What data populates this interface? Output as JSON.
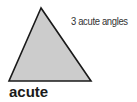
{
  "figure": {
    "shape": "acute-triangle",
    "vertices": [
      [
        41,
        8
      ],
      [
        9,
        81
      ],
      [
        91,
        81
      ]
    ],
    "fill_color": "#cccccc",
    "stroke_color": "#1a1a1a",
    "annotation": "3 acute angles",
    "label": "acute"
  }
}
